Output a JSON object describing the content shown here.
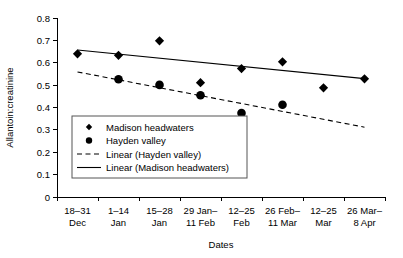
{
  "chart_data": {
    "type": "scatter",
    "title": "",
    "xlabel": "Dates",
    "ylabel": "Allantoin:creatinine",
    "categories": [
      "18–31 Dec",
      "1–14 Jan",
      "15–28 Jan",
      "29 Jan– 11 Feb",
      "12–25 Feb",
      "26 Feb– 11 Mar",
      "12–25 Mar",
      "26 Mar– 8 Apr"
    ],
    "category_lines": [
      [
        "18–31",
        "Dec"
      ],
      [
        "1–14",
        "Jan"
      ],
      [
        "15–28",
        "Jan"
      ],
      [
        "29 Jan–",
        "11 Feb"
      ],
      [
        "12–25",
        "Feb"
      ],
      [
        "26 Feb–",
        "11 Mar"
      ],
      [
        "12–25",
        "Mar"
      ],
      [
        "26 Mar–",
        "8 Apr"
      ]
    ],
    "ylim": [
      0,
      0.8
    ],
    "yticks": [
      0,
      0.1,
      0.2,
      0.3,
      0.4,
      0.5,
      0.6,
      0.7,
      0.8
    ],
    "ytick_labels": [
      "0",
      "0.1",
      "0.2",
      "0.3",
      "0.4",
      "0.5",
      "0.6",
      "0.7",
      "0.8"
    ],
    "grid": false,
    "legend_position": "lower-left-inside",
    "series": [
      {
        "name": "Madison headwaters",
        "marker": "diamond",
        "color": "#000000",
        "x": [
          0,
          1,
          2,
          3,
          4,
          5,
          6,
          7
        ],
        "values": [
          0.64,
          0.633,
          0.698,
          0.511,
          0.574,
          0.604,
          0.488,
          0.528
        ]
      },
      {
        "name": "Hayden valley",
        "marker": "circle",
        "color": "#000000",
        "x": [
          1,
          2,
          3,
          4,
          5
        ],
        "values": [
          0.526,
          0.501,
          0.455,
          0.375,
          0.412
        ]
      }
    ],
    "trendlines": [
      {
        "name": "Linear (Hayden valley)",
        "style": "dashed",
        "color": "#000000",
        "x0": 0,
        "y0": 0.559,
        "x1": 7,
        "y1": 0.312
      },
      {
        "name": "Linear (Madison headwaters)",
        "style": "solid",
        "color": "#000000",
        "x0": 0,
        "y0": 0.657,
        "x1": 7,
        "y1": 0.529
      }
    ],
    "legend": [
      {
        "label": "Madison headwaters",
        "symbol": "diamond"
      },
      {
        "label": "Hayden valley",
        "symbol": "circle"
      },
      {
        "label": "Linear (Hayden valley)",
        "symbol": "dashed-line"
      },
      {
        "label": "Linear (Madison headwaters)",
        "symbol": "solid-line"
      }
    ]
  }
}
